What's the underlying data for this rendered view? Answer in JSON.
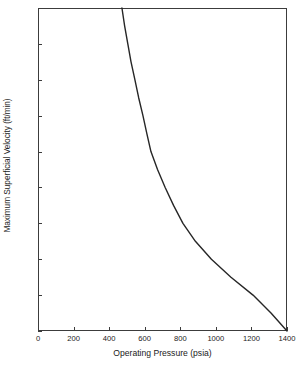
{
  "chart_data": {
    "type": "line",
    "title": "",
    "xlabel": "Operating Pressure (psia)",
    "ylabel": "Maximum Superficial Velocity (ft/min)",
    "xlim": [
      0,
      1400
    ],
    "ylim": [
      26,
      44
    ],
    "xticks": [
      0,
      200,
      400,
      600,
      800,
      1000,
      1200,
      1400
    ],
    "xtick_labels": [
      "0",
      "200",
      "400",
      "600",
      "800",
      "1000",
      "1200",
      "1400"
    ],
    "yticks": [
      26,
      28,
      30,
      32,
      34,
      36,
      38,
      40,
      42,
      44
    ],
    "ytick_labels": [
      "26",
      "28",
      "30",
      "32",
      "34",
      "36",
      "38",
      "40",
      "42",
      "44"
    ],
    "grid": false,
    "legend": null,
    "series": [
      {
        "name": "Maximum superficial velocity vs operating pressure",
        "color": "#262626",
        "line_width": 1.4,
        "x": [
          472,
          487,
          505,
          523,
          545,
          566,
          590,
          612,
          635,
          672,
          715,
          762,
          815,
          885,
          975,
          1085,
          1209,
          1310,
          1400
        ],
        "y": [
          44.0,
          43.0,
          42.0,
          41.0,
          40.0,
          39.0,
          38.0,
          37.0,
          36.0,
          35.0,
          34.0,
          33.0,
          32.0,
          31.0,
          30.0,
          29.0,
          28.0,
          27.0,
          26.0
        ]
      }
    ]
  },
  "axes": {
    "frame_color": "#3c3c3c"
  }
}
